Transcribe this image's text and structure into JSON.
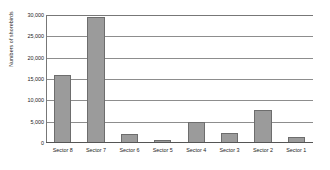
{
  "chart_data": {
    "type": "bar",
    "title": "",
    "xlabel": "",
    "ylabel": "Numbers of shorebirds",
    "categories": [
      "Sector 8",
      "Sector 7",
      "Sector 6",
      "Sector 5",
      "Sector 4",
      "Sector 3",
      "Sector 2",
      "Sector 1"
    ],
    "values": [
      16000,
      29500,
      2200,
      600,
      5000,
      2400,
      7800,
      1500
    ],
    "ylim": [
      0,
      30000
    ],
    "ytick_values": [
      0,
      5000,
      10000,
      15000,
      20000,
      25000,
      30000
    ],
    "ytick_labels": [
      "0",
      "5,000",
      "10,000",
      "15,000",
      "20,000",
      "25,000",
      "30,000"
    ],
    "grid": true,
    "legend": false,
    "bar_color": "#9b9b9b",
    "bar_border_color": "#6d6d6d",
    "gridline_color": "#8d8d8d",
    "axis_color": "#777777"
  }
}
